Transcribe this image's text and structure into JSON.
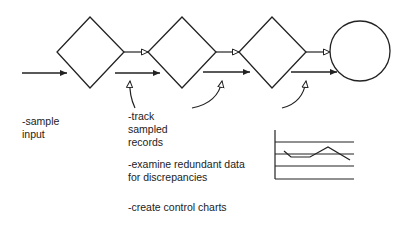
{
  "diagram": {
    "process_steps": [
      {
        "id": "step-1",
        "shape": "diamond"
      },
      {
        "id": "step-2",
        "shape": "diamond"
      },
      {
        "id": "step-3",
        "shape": "diamond"
      },
      {
        "id": "end",
        "shape": "circle"
      }
    ],
    "labels": {
      "sample_input": [
        "-sample",
        "input"
      ],
      "track": [
        "-track",
        "sampled",
        "records"
      ],
      "examine": [
        "-examine redundant data",
        "for discrepancies"
      ],
      "control": [
        "-create control charts"
      ]
    },
    "control_chart_icon": {
      "horizontal_lines": 4,
      "trace": "wavy line"
    },
    "colors": {
      "stroke": "#222222",
      "background": "#ffffff"
    }
  }
}
